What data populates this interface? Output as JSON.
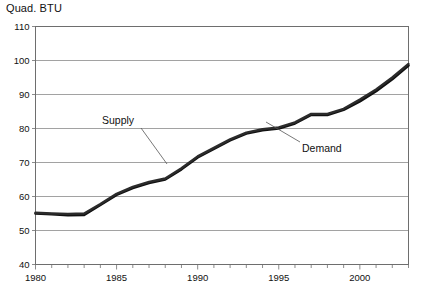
{
  "axis_title": "Quad. BTU",
  "annotations": {
    "supply_label": "Supply",
    "demand_label": "Demand"
  },
  "chart_data": {
    "type": "line",
    "title": "",
    "subtitle": "",
    "xlabel": "",
    "ylabel": "Quad. BTU",
    "xlim": [
      1980,
      2003
    ],
    "ylim": [
      40,
      110
    ],
    "ytick_step": 10,
    "yticks": [
      40,
      50,
      60,
      70,
      80,
      90,
      100,
      110
    ],
    "xticks_major": [
      1980,
      1985,
      1990,
      1995,
      2000
    ],
    "xticks_minor_every": 1,
    "grid": "horizontal",
    "legend": "none",
    "annotation_style": "leader-lines",
    "accent_color": "#111111",
    "grid_color": "#8a8a8a",
    "x": [
      1980,
      1981,
      1982,
      1983,
      1984,
      1985,
      1986,
      1987,
      1988,
      1989,
      1990,
      1991,
      1992,
      1993,
      1994,
      1995,
      1996,
      1997,
      1998,
      1999,
      2000,
      2001,
      2002,
      2003
    ],
    "series": [
      {
        "name": "Supply",
        "values": [
          55.0,
          54.8,
          54.5,
          54.6,
          57.5,
          60.5,
          62.5,
          64.0,
          65.0,
          68.0,
          71.5,
          74.0,
          76.5,
          78.5,
          79.5,
          80.0,
          81.5,
          84.0,
          84.0,
          85.5,
          88.0,
          91.0,
          94.5,
          98.5
        ],
        "color": "#111111"
      },
      {
        "name": "Demand",
        "values": [
          55.2,
          55.0,
          54.9,
          55.0,
          57.8,
          60.8,
          62.8,
          64.3,
          65.3,
          68.3,
          71.8,
          74.3,
          76.8,
          78.8,
          79.8,
          80.3,
          81.8,
          84.3,
          84.3,
          85.8,
          88.5,
          91.5,
          95.0,
          99.0
        ],
        "color": "#2b2b2b"
      }
    ]
  }
}
